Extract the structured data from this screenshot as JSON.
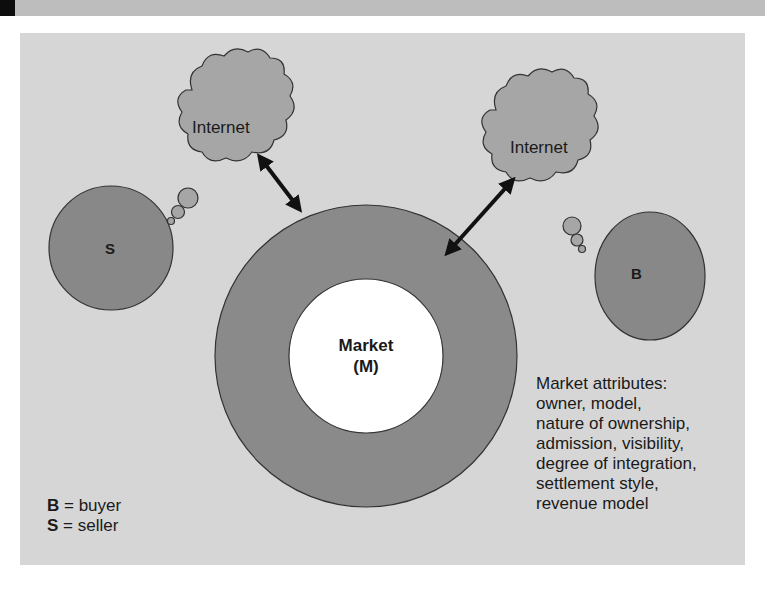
{
  "diagram": {
    "colors": {
      "panel": "#d6d6d6",
      "ring": "#8a8a8a",
      "node": "#888888",
      "cloud": "#a6a6a6",
      "market_core": "#ffffff",
      "arrow": "#111111",
      "top_band": "#bdbdbd"
    },
    "clouds": [
      {
        "id": "left",
        "label": "Internet"
      },
      {
        "id": "right",
        "label": "Internet"
      }
    ],
    "nodes": {
      "seller": {
        "label": "S"
      },
      "buyer": {
        "label": "B"
      }
    },
    "market": {
      "line1": "Market",
      "line2": "(M)"
    },
    "legend": {
      "b_key": "B",
      "b_text": " = buyer",
      "s_key": "S",
      "s_text": " = seller"
    },
    "attributes": {
      "lines": [
        "Market attributes:",
        "owner, model,",
        "nature of ownership,",
        "admission, visibility,",
        "degree of integration,",
        "settlement style,",
        "revenue model"
      ]
    },
    "arrows": [
      {
        "from": "left-internet-cloud",
        "to": "market-ring",
        "type": "bidirectional"
      },
      {
        "from": "right-internet-cloud",
        "to": "market-ring",
        "type": "bidirectional"
      }
    ]
  }
}
